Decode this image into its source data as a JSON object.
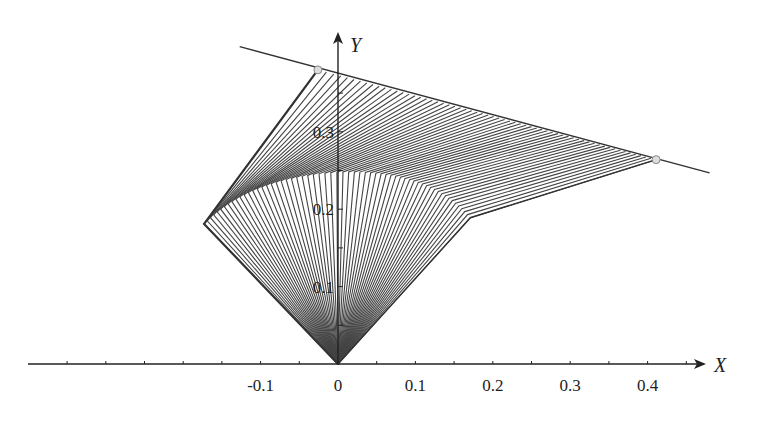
{
  "diagram": {
    "title": "",
    "axes": {
      "x_label": "X",
      "y_label": "Y",
      "x_ticks": [
        {
          "value": -0.1,
          "label": "-0.1"
        },
        {
          "value": 0,
          "label": "0"
        },
        {
          "value": 0.1,
          "label": "0.1"
        },
        {
          "value": 0.2,
          "label": "0.2"
        },
        {
          "value": 0.3,
          "label": "0.3"
        },
        {
          "value": 0.4,
          "label": "0.4"
        }
      ],
      "y_ticks": [
        {
          "value": 0.1,
          "label": "0.1"
        },
        {
          "value": 0.2,
          "label": "0.2"
        },
        {
          "value": 0.3,
          "label": "0.3"
        }
      ],
      "x_range": [
        -0.42,
        0.47
      ],
      "y_range": [
        0,
        0.42
      ]
    },
    "geometry": {
      "origin": [
        0,
        0
      ],
      "left_vertex": [
        -0.173,
        0.181
      ],
      "top_point": [
        -0.026,
        0.38
      ],
      "right_point": [
        0.411,
        0.264
      ],
      "lower_kink": [
        0.171,
        0.189
      ],
      "boundary_line": {
        "from": [
          -0.127,
          0.41
        ],
        "to": [
          0.48,
          0.247
        ]
      },
      "marked_points": [
        [
          -0.026,
          0.38
        ],
        [
          0.411,
          0.264
        ]
      ],
      "ray_count": 60
    },
    "colors": {
      "line": "#444444",
      "axis": "#222222",
      "marker_fill": "#dddddd",
      "marker_stroke": "#888888"
    }
  }
}
